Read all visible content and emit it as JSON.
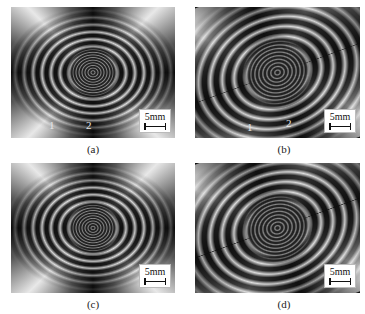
{
  "figure": {
    "panels": [
      {
        "id": "a",
        "caption": "(a)",
        "scale_bar": "5mm",
        "point_labels": [
          "1",
          "2"
        ],
        "rotated": false
      },
      {
        "id": "b",
        "caption": "(b)",
        "scale_bar": "5mm",
        "point_labels": [
          "1",
          "2"
        ],
        "rotated": true
      },
      {
        "id": "c",
        "caption": "(c)",
        "scale_bar": "5mm",
        "point_labels": [],
        "rotated": false
      },
      {
        "id": "d",
        "caption": "(d)",
        "scale_bar": "5mm",
        "point_labels": [],
        "rotated": true
      }
    ],
    "colors": {
      "fringe_dark": "#111111",
      "fringe_light": "#e8e8e8",
      "background": "#ffffff"
    }
  }
}
